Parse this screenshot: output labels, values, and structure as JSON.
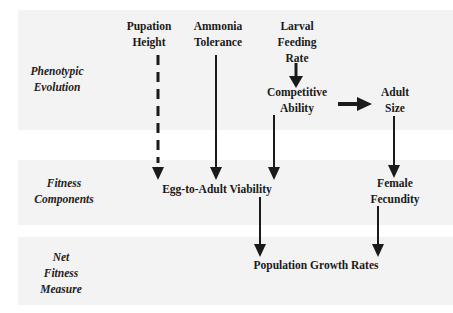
{
  "diagram": {
    "row_labels": [
      {
        "id": "phenotypic-evolution",
        "text": "Phenotypic\nEvolution"
      },
      {
        "id": "fitness-components",
        "text": "Fitness\nComponents"
      },
      {
        "id": "net-fitness-measure",
        "text": "Net\nFitness\nMeasure"
      }
    ],
    "nodes": {
      "pupation_height": "Pupation\nHeight",
      "ammonia_tolerance": "Ammonia\nTolerance",
      "larval_feeding_rate": "Larval\nFeeding\nRate",
      "competitive_ability": "Competitive\nAbility",
      "adult_size": "Adult\nSize",
      "egg_to_adult_viability": "Egg-to-Adult Viability",
      "female_fecundity": "Female\nFecundity",
      "population_growth_rates": "Population Growth Rates"
    },
    "edges": [
      {
        "from": "Pupation Height",
        "to": "Egg-to-Adult Viability",
        "style": "dashed"
      },
      {
        "from": "Ammonia Tolerance",
        "to": "Egg-to-Adult Viability",
        "style": "solid"
      },
      {
        "from": "Larval Feeding Rate",
        "to": "Competitive Ability",
        "style": "solid"
      },
      {
        "from": "Competitive Ability",
        "to": "Adult Size",
        "style": "solid"
      },
      {
        "from": "Competitive Ability",
        "to": "Egg-to-Adult Viability",
        "style": "solid"
      },
      {
        "from": "Adult Size",
        "to": "Female Fecundity",
        "style": "solid"
      },
      {
        "from": "Egg-to-Adult Viability",
        "to": "Population Growth Rates",
        "style": "solid"
      },
      {
        "from": "Female Fecundity",
        "to": "Population Growth Rates",
        "style": "solid"
      }
    ],
    "colors": {
      "band": "#f3f3f3",
      "ink": "#1a1a1a"
    }
  }
}
